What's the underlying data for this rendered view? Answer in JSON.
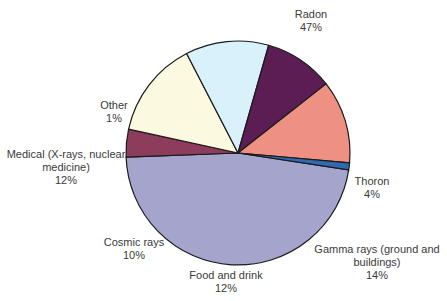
{
  "chart_data": {
    "type": "pie",
    "title": "",
    "start_angle_deg": 8.7,
    "direction": "clockwise",
    "center": [
      238,
      153
    ],
    "radius": 112,
    "slices": [
      {
        "label": "Radon",
        "value": 47,
        "pct_label": "47%",
        "color": "#a4a4cc"
      },
      {
        "label": "Thoron",
        "value": 4,
        "pct_label": "4%",
        "color": "#8e3c5c"
      },
      {
        "label": "Gamma rays (ground and buildings)",
        "value": 14,
        "pct_label": "14%",
        "color": "#fbfae0"
      },
      {
        "label": "Food and drink",
        "value": 12,
        "pct_label": "12%",
        "color": "#d9f1fb"
      },
      {
        "label": "Cosmic rays",
        "value": 10,
        "pct_label": "10%",
        "color": "#5c1d55"
      },
      {
        "label": "Medical (X-rays, nuclear medicine)",
        "value": 12,
        "pct_label": "12%",
        "color": "#ee9182"
      },
      {
        "label": "Other",
        "value": 1,
        "pct_label": "1%",
        "color": "#2f6ab0"
      }
    ]
  },
  "labels": {
    "radon": {
      "line1": "Radon",
      "line2": "47%"
    },
    "thoron": {
      "line1": "Thoron",
      "line2": "4%"
    },
    "gamma": {
      "line1": "Gamma rays (ground and",
      "line2": "buildings)",
      "line3": "14%"
    },
    "food": {
      "line1": "Food and drink",
      "line2": "12%"
    },
    "cosmic": {
      "line1": "Cosmic rays",
      "line2": "10%"
    },
    "medical": {
      "line1": "Medical (X-rays, nuclear",
      "line2": "medicine)",
      "line3": "12%"
    },
    "other": {
      "line1": "Other",
      "line2": "1%"
    }
  }
}
